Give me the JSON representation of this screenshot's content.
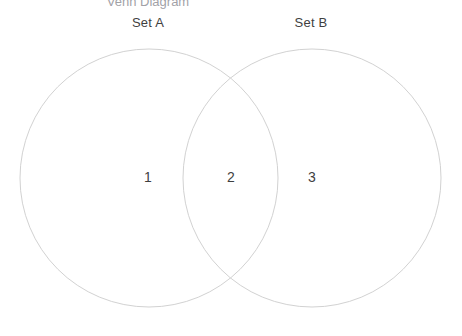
{
  "figure": {
    "width": 462,
    "height": 336,
    "background_color": "#ffffff",
    "clipped_title": "Venn Diagram"
  },
  "chart_data": {
    "type": "venn",
    "title": "Venn Diagram",
    "sets": [
      {
        "id": "A",
        "label": "Set A",
        "label_x": 148,
        "label_y": 22,
        "center_x": 149,
        "center_y": 178,
        "radius": 129
      },
      {
        "id": "B",
        "label": "Set B",
        "label_x": 311,
        "label_y": 22,
        "center_x": 312,
        "center_y": 178,
        "radius": 129
      }
    ],
    "regions": [
      {
        "id": "A_only",
        "label": "1",
        "value": 1,
        "x": 148,
        "y": 177
      },
      {
        "id": "A_and_B",
        "label": "2",
        "value": 2,
        "x": 231,
        "y": 177
      },
      {
        "id": "B_only",
        "label": "3",
        "value": 3,
        "x": 312,
        "y": 177
      }
    ],
    "stroke_color": "#d2d2d2",
    "fill_color": "none",
    "text_color": "#3f3f3f",
    "legend": "none",
    "grid": false
  }
}
